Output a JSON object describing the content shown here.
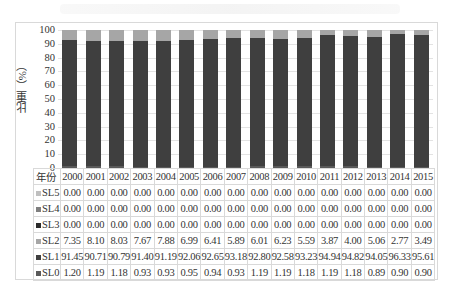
{
  "chart_data": {
    "type": "bar",
    "stacked": true,
    "title": "",
    "xlabel": "年份",
    "ylabel": "比重（%）",
    "ylim": [
      0,
      100
    ],
    "yticks": [
      0,
      10,
      20,
      30,
      40,
      50,
      60,
      70,
      80,
      90,
      100
    ],
    "grid": true,
    "legend_position": "table-left",
    "categories": [
      "2000",
      "2001",
      "2002",
      "2003",
      "2004",
      "2005",
      "2006",
      "2007",
      "2008",
      "2009",
      "2010",
      "2011",
      "2012",
      "2013",
      "2014",
      "2015"
    ],
    "series": [
      {
        "name": "SL0",
        "color": "#5a5a5a",
        "values": [
          "1.20",
          "1.19",
          "1.18",
          "0.93",
          "0.93",
          "0.95",
          "0.94",
          "0.93",
          "1.19",
          "1.19",
          "1.18",
          "1.19",
          "1.18",
          "0.89",
          "0.90",
          "0.90"
        ]
      },
      {
        "name": "SL1",
        "color": "#3f3f3f",
        "values": [
          "91.45",
          "90.71",
          "90.79",
          "91.40",
          "91.19",
          "92.06",
          "92.65",
          "93.18",
          "92.80",
          "92.58",
          "93.23",
          "94.94",
          "94.82",
          "94.05",
          "96.33",
          "95.61"
        ]
      },
      {
        "name": "SL2",
        "color": "#a6a6a6",
        "values": [
          "7.35",
          "8.10",
          "8.03",
          "7.67",
          "7.88",
          "6.99",
          "6.41",
          "5.89",
          "6.01",
          "6.23",
          "5.59",
          "3.87",
          "4.00",
          "5.06",
          "2.77",
          "3.49"
        ]
      },
      {
        "name": "SL3",
        "color": "#2b2b2b",
        "values": [
          "0.00",
          "0.00",
          "0.00",
          "0.00",
          "0.00",
          "0.00",
          "0.00",
          "0.00",
          "0.00",
          "0.00",
          "0.00",
          "0.00",
          "0.00",
          "0.00",
          "0.00",
          "0.00"
        ]
      },
      {
        "name": "SL4",
        "color": "#7f7f7f",
        "values": [
          "0.00",
          "0.00",
          "0.00",
          "0.00",
          "0.00",
          "0.00",
          "0.00",
          "0.00",
          "0.00",
          "0.00",
          "0.00",
          "0.00",
          "0.00",
          "0.00",
          "0.00",
          "0.00"
        ]
      },
      {
        "name": "SL5",
        "color": "#bfbfbf",
        "values": [
          "0.00",
          "0.00",
          "0.00",
          "0.00",
          "0.00",
          "0.00",
          "0.00",
          "0.00",
          "0.00",
          "0.00",
          "0.00",
          "0.00",
          "0.00",
          "0.00",
          "0.00",
          "0.00"
        ]
      }
    ],
    "table_row_order": [
      "SL5",
      "SL4",
      "SL3",
      "SL2",
      "SL1",
      "SL0"
    ]
  }
}
